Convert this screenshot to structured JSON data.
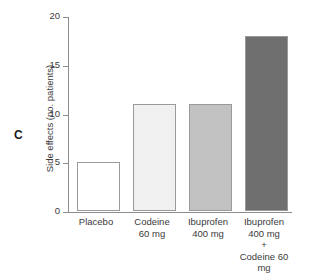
{
  "figure": {
    "panel_label": "C",
    "background_color": "#ffffff"
  },
  "chart_data": {
    "type": "bar",
    "title": "",
    "xlabel": "",
    "ylabel": "Side effects (no. patients)",
    "categories": [
      "Placebo",
      "Codeine\n60 mg",
      "Ibuprofen\n400 mg",
      "Ibuprofen\n400 mg\n+\nCodeine 60 mg"
    ],
    "category_lines": [
      [
        "Placebo"
      ],
      [
        "Codeine",
        "60 mg"
      ],
      [
        "Ibuprofen",
        "400 mg"
      ],
      [
        "Ibuprofen",
        "400 mg",
        "+",
        "Codeine 60 mg"
      ]
    ],
    "values": [
      5,
      11,
      11,
      18
    ],
    "bar_colors": [
      "#ffffff",
      "#f0f0f0",
      "#c2c2c2",
      "#6f6f6f"
    ],
    "bar_border_color": "#9a9a9a",
    "ylim": [
      0,
      20
    ],
    "yticks": [
      0,
      5,
      10,
      15,
      20
    ],
    "ytick_labels": [
      "0",
      "5",
      "10",
      "15",
      "20"
    ],
    "grid": false,
    "legend": "none",
    "axis_color": "#8d8d8d"
  }
}
